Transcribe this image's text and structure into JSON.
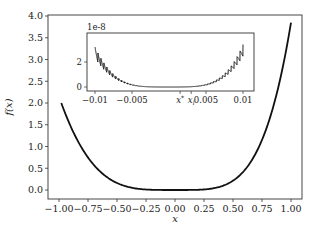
{
  "chart_data": [
    {
      "type": "line",
      "title": "",
      "xlabel": "x",
      "ylabel": "f(x)",
      "xlim": [
        -1.1,
        1.1
      ],
      "ylim": [
        -0.2,
        4.0
      ],
      "grid": false,
      "legend": null,
      "x_ticks": [
        -1.0,
        -0.75,
        -0.5,
        -0.25,
        0.0,
        0.25,
        0.5,
        0.75,
        1.0
      ],
      "x_tick_labels": [
        "−1.00",
        "−0.75",
        "−0.50",
        "−0.25",
        "0.00",
        "0.25",
        "0.50",
        "0.75",
        "1.00"
      ],
      "y_ticks": [
        0.0,
        0.5,
        1.0,
        1.5,
        2.0,
        2.5,
        3.0,
        3.5,
        4.0
      ],
      "y_tick_labels": [
        "0.0",
        "0.5",
        "1.0",
        "1.5",
        "2.0",
        "2.5",
        "3.0",
        "3.5",
        "4.0"
      ],
      "series": [
        {
          "name": "f(x)",
          "color": "#111111",
          "x": [
            -0.98,
            -0.9,
            -0.8,
            -0.7,
            -0.6,
            -0.5,
            -0.4,
            -0.3,
            -0.2,
            -0.1,
            0.0,
            0.1,
            0.2,
            0.3,
            0.4,
            0.5,
            0.6,
            0.7,
            0.8,
            0.9,
            1.0
          ],
          "y": [
            2.14,
            1.47,
            0.95,
            0.58,
            0.32,
            0.16,
            0.07,
            0.02,
            0.0,
            0.0,
            0.0,
            0.0,
            0.01,
            0.03,
            0.09,
            0.21,
            0.46,
            0.86,
            1.51,
            2.47,
            3.85
          ]
        }
      ]
    },
    {
      "type": "line",
      "title": "",
      "role": "inset",
      "offset_text": "1e-8",
      "xlim": [
        -0.0105,
        0.0105
      ],
      "ylim": [
        -0.2,
        3.8
      ],
      "x_ticks": [
        -0.01,
        -0.005,
        0.0015,
        0.003,
        0.005,
        0.01
      ],
      "x_tick_labels": [
        "−0.01",
        "−0.005",
        "x*",
        "x_l",
        "0.005",
        "0.01"
      ],
      "y_ticks": [
        0,
        2
      ],
      "y_tick_labels": [
        "0",
        "2"
      ],
      "annotation": "oscillating (sawtooth) band around a quartic-like curve",
      "series": [
        {
          "name": "f(x) zoomed",
          "color": "#111111",
          "x": [
            -0.01,
            -0.009,
            -0.008,
            -0.007,
            -0.006,
            -0.005,
            -0.004,
            -0.003,
            -0.002,
            -0.001,
            0.0,
            0.001,
            0.002,
            0.003,
            0.004,
            0.005,
            0.006,
            0.007,
            0.008,
            0.009,
            0.01
          ],
          "y": [
            3.3,
            2.4,
            1.7,
            1.15,
            0.72,
            0.42,
            0.2,
            0.08,
            0.02,
            0.0,
            0.0,
            0.0,
            0.02,
            0.08,
            0.2,
            0.42,
            0.72,
            1.15,
            1.7,
            2.4,
            3.5
          ]
        }
      ]
    }
  ]
}
